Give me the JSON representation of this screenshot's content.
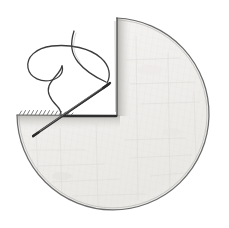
{
  "scene": {
    "title": "Sewing needle and thread stitching a circular fabric disc with a wedge cut out",
    "background_color": "#ffffff",
    "width": 229,
    "height": 228,
    "medium": "pencil-drawing",
    "alt_text": "Hand-drawn pencil illustration: a light grey circular disc seen from above with a pie-slice wedge removed from the upper-left; a fine sewing needle pierces the horizontal cut edge diagonally and a thread curls above it into a teardrop loop."
  },
  "disc": {
    "name": "circular-fabric-disc",
    "fill_color": "#f3f2f1",
    "fill_color_shaded": "#e7e6e4",
    "outline_color": "#6b6b6b",
    "center_x": 113,
    "center_y": 114,
    "radius": 96,
    "notch_label": "wedge-cut-out",
    "notch_start_angle_deg": 180,
    "notch_end_angle_deg": 270,
    "notch_corner_x": 117,
    "notch_corner_y": 115,
    "notch_top_x": 117,
    "notch_top_y": 18,
    "notch_left_x": 17,
    "notch_left_y": 115
  },
  "cut_edge": {
    "name": "horizontal-cut-edge",
    "x_start": 17,
    "x_end": 117,
    "y": 115,
    "color": "#555555",
    "texture": "serrated-stitch-marks",
    "stitch_count": 14,
    "stitch_x_start": 19,
    "stitch_x_end": 72
  },
  "vertical_edge": {
    "name": "vertical-cut-edge",
    "x": 117,
    "y_top": 18,
    "y_bottom": 115,
    "color": "#6b6b6b"
  },
  "needle": {
    "name": "sewing-needle",
    "tip_x": 33,
    "tip_y": 136,
    "eye_x": 109,
    "eye_y": 84,
    "color": "#4a4a4a",
    "highlight_color": "#9a9a9a",
    "thickness": 2.2,
    "orientation": "diagonal-lower-left-to-upper-right"
  },
  "thread": {
    "name": "sewing-thread",
    "color": "#3c3c3c",
    "thickness": 1.3,
    "loop_shape": "teardrop",
    "tail_top_x": 74,
    "tail_top_y": 31,
    "loop_left_x": 28,
    "loop_left_y": 70,
    "anchor_x": 61,
    "anchor_y": 115
  },
  "shadow": {
    "name": "needle-shadow",
    "color": "#2e2e2e",
    "x_start": 62,
    "x_end": 116,
    "y": 116
  }
}
